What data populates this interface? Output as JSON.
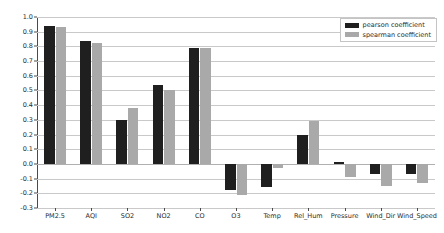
{
  "chart_data": {
    "type": "bar",
    "title": "",
    "xlabel": "",
    "ylabel": "",
    "ylim": [
      -0.3,
      1.0
    ],
    "ytick_labels": [
      "1.0",
      "0.9",
      "0.8",
      "0.7",
      "0.6",
      "0.5",
      "0.4",
      "0.3",
      "0.2",
      "0.1",
      "0.0",
      "-0.1",
      "-0.2",
      "-0.3"
    ],
    "ytick_values": [
      1.0,
      0.9,
      0.8,
      0.7,
      0.6,
      0.5,
      0.4,
      0.3,
      0.2,
      0.1,
      0.0,
      -0.1,
      -0.2,
      -0.3
    ],
    "grid": true,
    "legend_position": "upper right",
    "categories": [
      "PM2.5",
      "AQI",
      "SO2",
      "NO2",
      "CO",
      "O3",
      "Temp",
      "Rel_Hum",
      "Pressure",
      "Wind_Dir",
      "Wind_Speed"
    ],
    "series": [
      {
        "name": "pearson coefficient",
        "color": "#1f1f1f",
        "values": [
          0.94,
          0.84,
          0.3,
          0.54,
          0.79,
          -0.18,
          -0.16,
          0.2,
          0.01,
          -0.07,
          -0.07
        ]
      },
      {
        "name": "spearman coefficient",
        "color": "#a9a9a9",
        "values": [
          0.93,
          0.82,
          0.38,
          0.5,
          0.79,
          -0.21,
          -0.03,
          0.29,
          -0.09,
          -0.15,
          -0.13
        ]
      }
    ]
  },
  "legend": {
    "items": [
      {
        "label": "pearson coefficient",
        "swatch": "pearson"
      },
      {
        "label": "spearman coefficient",
        "swatch": "spearman"
      }
    ]
  }
}
